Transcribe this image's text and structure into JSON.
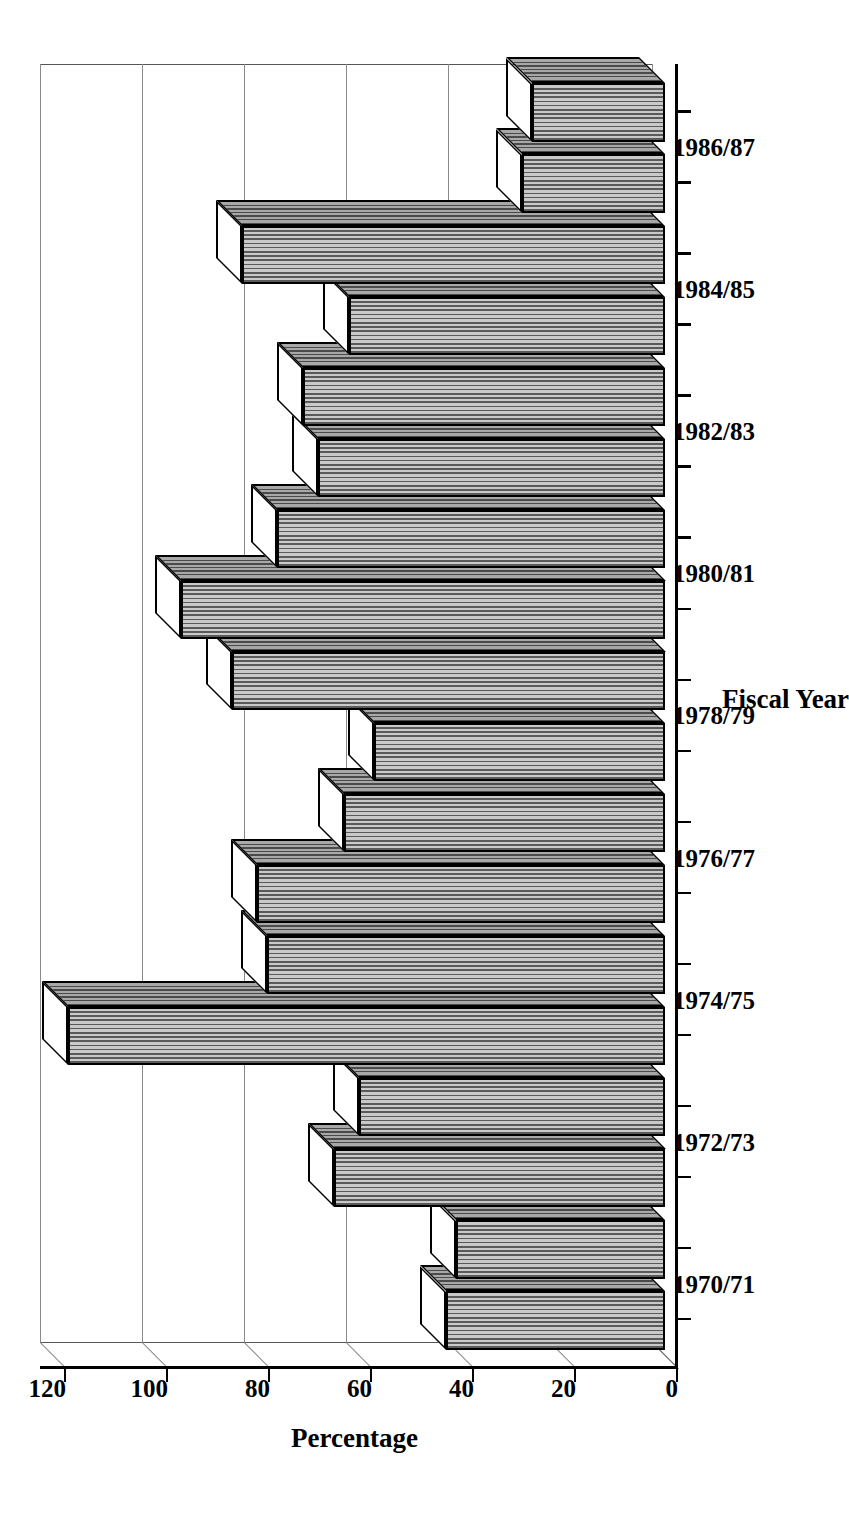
{
  "chart_data": {
    "type": "bar",
    "title": "",
    "subtitle": "",
    "xlabel": "Fiscal Year",
    "ylabel": "Percentage",
    "grid": true,
    "legend": "none",
    "orientation": "rotated-90-ccw-on-page",
    "style": "3d-column-hatched",
    "ylim": [
      0,
      120
    ],
    "yticks": [
      0,
      20,
      40,
      60,
      80,
      100,
      120
    ],
    "ytick_labels": [
      "0",
      "20",
      "40",
      "60",
      "80",
      "100",
      "120"
    ],
    "xtick_labels": [
      "1970/71",
      "1972/73",
      "1974/75",
      "1976/77",
      "1978/79",
      "1980/81",
      "1982/83",
      "1984/85",
      "1986/87"
    ],
    "xtick_label_interval": 2,
    "n_bars": 18,
    "categories": [
      "1970/71",
      "1971/72",
      "1972/73",
      "1973/74",
      "1974/75",
      "1975/76",
      "1976/77",
      "1977/78",
      "1978/79",
      "1979/80",
      "1980/81",
      "1981/82",
      "1982/83",
      "1983/84",
      "1984/85",
      "1985/86",
      "1986/87",
      "1987/88"
    ],
    "values": [
      43,
      41,
      65,
      60,
      117,
      78,
      80,
      63,
      57,
      85,
      95,
      76,
      68,
      71,
      62,
      83,
      28,
      26
    ],
    "annotations": []
  },
  "axes": {
    "y_axis_title": "Percentage",
    "x_axis_title": "Fiscal Year"
  },
  "colors": {
    "bar_fill_dark": "#5a5a5a",
    "bar_fill_light": "#c9c9c9",
    "outline": "#000000",
    "grid": "#8a8a8a",
    "background": "#ffffff"
  }
}
